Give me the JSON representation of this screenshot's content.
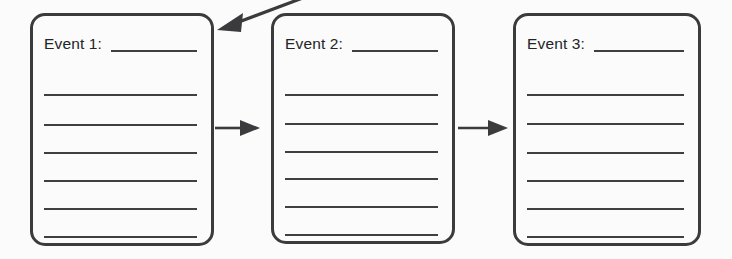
{
  "worksheet": {
    "title": "Sequence of Events Graphic Organizer",
    "background_color": "#fbfbfb",
    "ink_color": "#3b3b3d",
    "box_count": 3,
    "lines_per_box": 7
  },
  "boxes": [
    {
      "id": "event-1",
      "label": "Event 1:",
      "label_blank_value": "",
      "blank_lines": [
        "",
        "",
        "",
        "",
        "",
        ""
      ]
    },
    {
      "id": "event-2",
      "label": "Event 2:",
      "label_blank_value": "",
      "blank_lines": [
        "",
        "",
        "",
        "",
        "",
        ""
      ]
    },
    {
      "id": "event-3",
      "label": "Event 3:",
      "label_blank_value": "",
      "blank_lines": [
        "",
        "",
        "",
        "",
        "",
        ""
      ]
    }
  ],
  "connectors": [
    {
      "id": "arrow-incoming-diagonal",
      "kind": "diagonal-arrow",
      "direction": "up-right-to-down-left",
      "points_to": "event-1"
    },
    {
      "id": "arrow-event1-to-event2",
      "kind": "horizontal-arrow",
      "direction": "right",
      "from": "event-1",
      "to": "event-2"
    },
    {
      "id": "arrow-event2-to-event3",
      "kind": "horizontal-arrow",
      "direction": "right",
      "from": "event-2",
      "to": "event-3"
    }
  ]
}
